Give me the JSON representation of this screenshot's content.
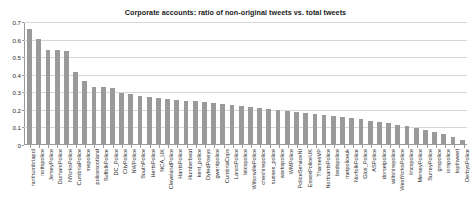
{
  "chart_data": {
    "type": "bar",
    "title": "Corporate accounts: ratio of non-original tweets vs. total tweets",
    "xlabel": "",
    "ylabel": "",
    "ylim": [
      0,
      0.7
    ],
    "ytick_labels": [
      "0.7",
      "0.6",
      "0.5",
      "0.4",
      "0.3",
      "0.2",
      "0.1",
      "0"
    ],
    "ytick_values": [
      0.7,
      0.6,
      0.5,
      0.4,
      0.3,
      0.2,
      0.1,
      0
    ],
    "grid": true,
    "legend": null,
    "bar_color": "#9a9a9a",
    "categories": [
      "northumbriapol",
      "nottspolice",
      "JerseyPolice",
      "DurhamPolice",
      "NYorksPolice",
      "CumbriaPolice",
      "mepolice",
      "policescotland",
      "SuffolkPolice",
      "DC_Police",
      "CityPolice",
      "NWPolice",
      "SouthPolice",
      "HertsPolice",
      "NCA_UK",
      "ClevelandPolice",
      "HantsPolice",
      "Humberbeat",
      "kent_police",
      "DyfedPowys",
      "gwentpolice",
      "CumbriaCops",
      "LancsPolice",
      "leicspolice",
      "WiltonvillePolice",
      "cheshirepolice",
      "sussex_police",
      "warkspolice",
      "WMPolice",
      "PoliceServiceNI",
      "EssexPoliceUK",
      "ThamesVP",
      "NorthantsPolice",
      "bedspolice",
      "metpoliceuk",
      "NorfolkPolice",
      "Glos_Police",
      "ASPolice",
      "dorsetpolice",
      "wiltshirepolice",
      "WestYorksPolice",
      "lincspolice",
      "MerseyPolice",
      "SurreyPolice",
      "gmpolice",
      "iompolice",
      "topthweet",
      "DerbysPolice"
    ],
    "values": [
      0.652,
      0.597,
      0.533,
      0.533,
      0.531,
      0.407,
      0.357,
      0.322,
      0.323,
      0.318,
      0.288,
      0.283,
      0.275,
      0.268,
      0.263,
      0.258,
      0.252,
      0.247,
      0.243,
      0.238,
      0.232,
      0.227,
      0.222,
      0.217,
      0.212,
      0.207,
      0.2,
      0.195,
      0.19,
      0.185,
      0.178,
      0.172,
      0.167,
      0.16,
      0.155,
      0.148,
      0.14,
      0.132,
      0.125,
      0.118,
      0.11,
      0.1,
      0.092,
      0.082,
      0.07,
      0.058,
      0.04,
      0.022
    ]
  }
}
